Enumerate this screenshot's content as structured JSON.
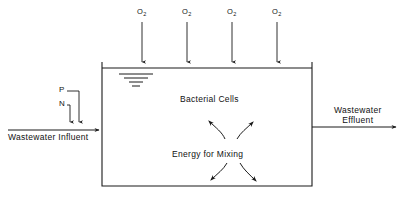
{
  "diagram": {
    "line_color": "#1a1a1a",
    "background_color": "#ffffff",
    "tank": {
      "left": 102,
      "top": 68,
      "right": 312,
      "bottom": 186
    },
    "gas_inlets": {
      "label": "O",
      "subscript": "2",
      "count": 4,
      "x_positions": [
        142,
        187,
        232,
        277
      ],
      "label_y": 14,
      "arrow_top": 22,
      "arrow_bottom": 68
    },
    "nutrients": [
      {
        "name": "phosphorus",
        "label": "P",
        "label_x": 59,
        "label_y": 89,
        "drop_x": 79,
        "corner_y": 93
      },
      {
        "name": "nitrogen",
        "label": "N",
        "label_x": 59,
        "label_y": 103,
        "drop_x": 70,
        "corner_y": 107
      }
    ],
    "influent": {
      "label": "Wastewater  Influent",
      "label_x": 8,
      "label_y": 134,
      "line_y": 130,
      "line_start_x": 8,
      "line_end_x": 102
    },
    "effluent": {
      "label_line1": "Wastewater",
      "label_line2": "Effluent",
      "label_x": 336,
      "label_y": 110,
      "line_y": 127,
      "line_start_x": 312,
      "line_end_x": 398
    },
    "water_surface": {
      "name": "water-level-symbol",
      "center_x": 136,
      "top_y": 72,
      "widths": [
        34,
        24,
        14,
        7
      ],
      "spacing": 4
    },
    "inner_labels": [
      {
        "name": "bacterial-cells-label",
        "text": "Bacterial  Cells",
        "x": 207,
        "y": 100
      },
      {
        "name": "energy-for-mixing-label",
        "text": "Energy  for  Mixing",
        "x": 201,
        "y": 155
      }
    ],
    "mixing_arrows": [
      {
        "name": "mixing-arrow-upper-left",
        "direction": "up-left"
      },
      {
        "name": "mixing-arrow-upper-right",
        "direction": "up-right"
      },
      {
        "name": "mixing-arrow-lower-left",
        "direction": "down-left"
      },
      {
        "name": "mixing-arrow-lower-right",
        "direction": "down-right"
      }
    ]
  }
}
